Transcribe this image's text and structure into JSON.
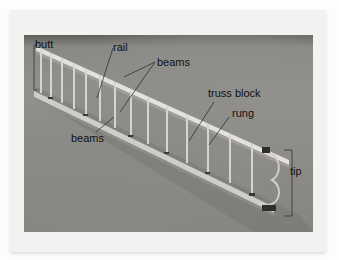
{
  "figure": {
    "labels": {
      "butt": "butt",
      "rail": "rail",
      "beams_top": "beams",
      "truss_block": "truss block",
      "rung": "rung",
      "beams_bottom": "beams",
      "tip": "tip"
    }
  },
  "colors": {
    "card": "#f2f2f0",
    "photo_ground": "#8c8b87",
    "ladder_metal": "#d8d6d0",
    "label_text": "#111111"
  }
}
